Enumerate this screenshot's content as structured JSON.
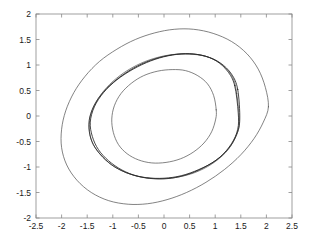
{
  "chart_data": {
    "type": "line",
    "title": "",
    "subtitle": "",
    "xlabel": "",
    "ylabel": "",
    "xlim": [
      -2.5,
      2.5
    ],
    "ylim": [
      -2,
      2
    ],
    "grid": false,
    "legend": "none",
    "background_color": "#ffffff",
    "axis_color": "#888888",
    "xticks": [
      -2.5,
      -2,
      -1.5,
      -1,
      -0.5,
      0,
      0.5,
      1,
      1.5,
      2,
      2.5
    ],
    "xtick_labels": [
      "-2.5",
      "-2",
      "-1.5",
      "-1",
      "-0.5",
      "0",
      "0.5",
      "1",
      "1.5",
      "2",
      "2.5"
    ],
    "yticks": [
      -2,
      -1.5,
      -1,
      -0.5,
      0,
      0.5,
      1,
      1.5,
      2
    ],
    "ytick_labels": [
      "-2",
      "-1.5",
      "-1",
      "-0.5",
      "0",
      "0.5",
      "1",
      "1.5",
      "2"
    ],
    "series": [
      {
        "name": "outer-orbit",
        "color": "#4d4d4d",
        "width": 0.7,
        "closed": true,
        "comment": "Outer rounded orbit, tilted about 15 degrees, semi-extent x about 2.05 and y about 1.72, center near (0.0, -0.02)",
        "points": [
          [
            2.04,
            0.18
          ],
          [
            1.98,
            0.56
          ],
          [
            1.84,
            0.92
          ],
          [
            1.62,
            1.22
          ],
          [
            1.32,
            1.46
          ],
          [
            0.96,
            1.62
          ],
          [
            0.58,
            1.7
          ],
          [
            0.2,
            1.7
          ],
          [
            -0.18,
            1.63
          ],
          [
            -0.56,
            1.5
          ],
          [
            -0.92,
            1.31
          ],
          [
            -1.26,
            1.07
          ],
          [
            -1.54,
            0.78
          ],
          [
            -1.76,
            0.46
          ],
          [
            -1.92,
            0.1
          ],
          [
            -2.0,
            -0.26
          ],
          [
            -2.0,
            -0.62
          ],
          [
            -1.9,
            -0.96
          ],
          [
            -1.7,
            -1.26
          ],
          [
            -1.42,
            -1.5
          ],
          [
            -1.08,
            -1.66
          ],
          [
            -0.7,
            -1.73
          ],
          [
            -0.32,
            -1.72
          ],
          [
            0.06,
            -1.64
          ],
          [
            0.44,
            -1.5
          ],
          [
            0.82,
            -1.3
          ],
          [
            1.18,
            -1.05
          ],
          [
            1.5,
            -0.76
          ],
          [
            1.76,
            -0.44
          ],
          [
            1.94,
            -0.12
          ],
          [
            2.04,
            0.18
          ]
        ]
      },
      {
        "name": "middle-orbit-a",
        "color": "#1a1a1a",
        "width": 0.8,
        "closed": true,
        "comment": "Middle tilted limit cycle, rotated about 30 degrees, semi-major about 1.88, semi-minor about 0.72",
        "points": [
          [
            1.44,
            0.52
          ],
          [
            1.32,
            0.82
          ],
          [
            1.1,
            1.04
          ],
          [
            0.82,
            1.17
          ],
          [
            0.5,
            1.22
          ],
          [
            0.16,
            1.2
          ],
          [
            -0.18,
            1.12
          ],
          [
            -0.52,
            0.98
          ],
          [
            -0.84,
            0.78
          ],
          [
            -1.12,
            0.54
          ],
          [
            -1.33,
            0.27
          ],
          [
            -1.45,
            -0.02
          ],
          [
            -1.46,
            -0.3
          ],
          [
            -1.38,
            -0.56
          ],
          [
            -1.2,
            -0.8
          ],
          [
            -0.96,
            -1.0
          ],
          [
            -0.66,
            -1.14
          ],
          [
            -0.34,
            -1.21
          ],
          [
            0.0,
            -1.22
          ],
          [
            0.34,
            -1.17
          ],
          [
            0.68,
            -1.05
          ],
          [
            1.0,
            -0.88
          ],
          [
            1.26,
            -0.64
          ],
          [
            1.42,
            -0.36
          ],
          [
            1.48,
            -0.06
          ],
          [
            1.44,
            0.52
          ]
        ]
      },
      {
        "name": "middle-orbit-b",
        "color": "#1a1a1a",
        "width": 0.8,
        "closed": true,
        "comment": "Second nearly-coincident middle orbit, slightly inside orbit-a on the upper-left and outside on the lower-right",
        "points": [
          [
            1.38,
            0.6
          ],
          [
            1.24,
            0.88
          ],
          [
            1.02,
            1.08
          ],
          [
            0.74,
            1.19
          ],
          [
            0.42,
            1.22
          ],
          [
            0.08,
            1.18
          ],
          [
            -0.26,
            1.08
          ],
          [
            -0.6,
            0.92
          ],
          [
            -0.92,
            0.71
          ],
          [
            -1.18,
            0.46
          ],
          [
            -1.36,
            0.18
          ],
          [
            -1.44,
            -0.12
          ],
          [
            -1.4,
            -0.4
          ],
          [
            -1.28,
            -0.66
          ],
          [
            -1.08,
            -0.88
          ],
          [
            -0.82,
            -1.06
          ],
          [
            -0.52,
            -1.18
          ],
          [
            -0.2,
            -1.23
          ],
          [
            0.14,
            -1.22
          ],
          [
            0.48,
            -1.14
          ],
          [
            0.8,
            -1.0
          ],
          [
            1.1,
            -0.8
          ],
          [
            1.32,
            -0.54
          ],
          [
            1.44,
            -0.26
          ],
          [
            1.45,
            0.06
          ],
          [
            1.38,
            0.6
          ]
        ]
      },
      {
        "name": "middle-orbit-c",
        "color": "#333333",
        "width": 0.6,
        "closed": true,
        "comment": "Third faint middle orbit nearly overlapping the other two",
        "points": [
          [
            1.42,
            0.44
          ],
          [
            1.34,
            0.76
          ],
          [
            1.14,
            1.0
          ],
          [
            0.88,
            1.15
          ],
          [
            0.56,
            1.21
          ],
          [
            0.22,
            1.21
          ],
          [
            -0.12,
            1.15
          ],
          [
            -0.46,
            1.03
          ],
          [
            -0.78,
            0.85
          ],
          [
            -1.06,
            0.62
          ],
          [
            -1.28,
            0.35
          ],
          [
            -1.42,
            0.06
          ],
          [
            -1.46,
            -0.24
          ],
          [
            -1.4,
            -0.52
          ],
          [
            -1.24,
            -0.76
          ],
          [
            -1.02,
            -0.96
          ],
          [
            -0.74,
            -1.11
          ],
          [
            -0.42,
            -1.2
          ],
          [
            -0.08,
            -1.23
          ],
          [
            0.26,
            -1.2
          ],
          [
            0.6,
            -1.11
          ],
          [
            0.92,
            -0.95
          ],
          [
            1.2,
            -0.72
          ],
          [
            1.38,
            -0.45
          ],
          [
            1.47,
            -0.14
          ],
          [
            1.42,
            0.44
          ]
        ]
      },
      {
        "name": "inner-orbit",
        "color": "#4d4d4d",
        "width": 0.7,
        "closed": true,
        "comment": "Inner ellipse, slightly tilted, x extent about -1.02 to 1.02, y extent about -0.90 to 0.90, center near (0.0, 0.0)",
        "points": [
          [
            1.02,
            0.12
          ],
          [
            0.97,
            0.4
          ],
          [
            0.85,
            0.63
          ],
          [
            0.66,
            0.79
          ],
          [
            0.42,
            0.89
          ],
          [
            0.16,
            0.91
          ],
          [
            -0.12,
            0.88
          ],
          [
            -0.4,
            0.79
          ],
          [
            -0.64,
            0.64
          ],
          [
            -0.84,
            0.44
          ],
          [
            -0.97,
            0.2
          ],
          [
            -1.02,
            -0.06
          ],
          [
            -0.99,
            -0.32
          ],
          [
            -0.89,
            -0.56
          ],
          [
            -0.72,
            -0.74
          ],
          [
            -0.5,
            -0.86
          ],
          [
            -0.24,
            -0.92
          ],
          [
            0.04,
            -0.91
          ],
          [
            0.32,
            -0.84
          ],
          [
            0.57,
            -0.71
          ],
          [
            0.78,
            -0.53
          ],
          [
            0.93,
            -0.31
          ],
          [
            1.01,
            -0.06
          ],
          [
            1.02,
            0.12
          ]
        ]
      }
    ]
  }
}
